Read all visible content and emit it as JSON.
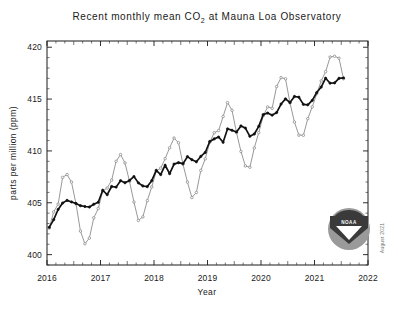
{
  "figure": {
    "title_part1": "Recent monthly mean CO",
    "title_sub": "2",
    "title_part2": " at Mauna Loa Observatory",
    "title_full": "Recent monthly mean CO2 at Mauna Loa Observatory",
    "credit": "August 2021",
    "logo_label": "NOAA",
    "colors": {
      "background": "#ffffff",
      "axis": "#1a1a1a",
      "monthly_series": "#8c8c8c",
      "trend_series": "#111111",
      "logo_ring": "#9a9a9a",
      "logo_band": "#3a3a3a"
    }
  },
  "chart_data": {
    "type": "line",
    "title": "Recent monthly mean CO2 at Mauna Loa Observatory",
    "xlabel": "Year",
    "ylabel": "parts per million (ppm)",
    "xlim": [
      2016.0,
      2022.0
    ],
    "ylim": [
      399.0,
      420.6
    ],
    "x_ticks": [
      "2016",
      "2017",
      "2018",
      "2019",
      "2020",
      "2021",
      "2022"
    ],
    "x_tick_values": [
      2016,
      2017,
      2018,
      2019,
      2020,
      2021,
      2022
    ],
    "x_minor_interval_months": 2,
    "y_ticks": [
      "400",
      "405",
      "410",
      "415",
      "420"
    ],
    "y_tick_values": [
      400,
      405,
      410,
      415,
      420
    ],
    "y_minor_interval": 1,
    "grid": false,
    "legend": false,
    "x": [
      2016.042,
      2016.125,
      2016.208,
      2016.292,
      2016.375,
      2016.458,
      2016.542,
      2016.625,
      2016.708,
      2016.792,
      2016.875,
      2016.958,
      2017.042,
      2017.125,
      2017.208,
      2017.292,
      2017.375,
      2017.458,
      2017.542,
      2017.625,
      2017.708,
      2017.792,
      2017.875,
      2017.958,
      2018.042,
      2018.125,
      2018.208,
      2018.292,
      2018.375,
      2018.458,
      2018.542,
      2018.625,
      2018.708,
      2018.792,
      2018.875,
      2018.958,
      2019.042,
      2019.125,
      2019.208,
      2019.292,
      2019.375,
      2019.458,
      2019.542,
      2019.625,
      2019.708,
      2019.792,
      2019.875,
      2019.958,
      2020.042,
      2020.125,
      2020.208,
      2020.292,
      2020.375,
      2020.458,
      2020.542,
      2020.625,
      2020.708,
      2020.792,
      2020.875,
      2020.958,
      2021.042,
      2021.125,
      2021.208,
      2021.292,
      2021.375,
      2021.458,
      2021.542
    ],
    "series": [
      {
        "name": "Monthly mean",
        "color": "#8c8c8c",
        "marker": "circle",
        "values": [
          402.56,
          404.12,
          404.87,
          407.45,
          407.72,
          406.99,
          404.89,
          402.27,
          401.05,
          401.59,
          403.55,
          404.45,
          406.13,
          406.42,
          407.18,
          409.0,
          409.65,
          408.84,
          407.07,
          405.07,
          403.3,
          403.64,
          405.21,
          406.53,
          408.05,
          408.34,
          409.25,
          410.3,
          411.24,
          410.79,
          408.71,
          406.99,
          405.51,
          405.99,
          408.12,
          409.24,
          410.83,
          411.75,
          411.97,
          413.32,
          414.66,
          413.92,
          411.77,
          409.95,
          408.55,
          408.43,
          410.29,
          411.76,
          413.4,
          414.24,
          414.11,
          416.21,
          417.07,
          416.96,
          414.62,
          412.78,
          411.52,
          411.51,
          413.11,
          414.25,
          415.52,
          416.75,
          417.64,
          419.05,
          419.13,
          418.94,
          416.96
        ]
      },
      {
        "name": "Seasonally adjusted trend",
        "color": "#111111",
        "marker": "circle",
        "values": [
          402.63,
          403.37,
          404.35,
          404.97,
          405.23,
          405.08,
          404.94,
          404.72,
          404.64,
          404.59,
          404.86,
          405.05,
          406.21,
          405.78,
          406.57,
          406.51,
          407.13,
          406.93,
          407.15,
          407.53,
          406.92,
          406.62,
          406.56,
          407.13,
          408.13,
          407.72,
          408.62,
          407.81,
          408.73,
          408.87,
          408.77,
          409.45,
          409.15,
          408.95,
          409.47,
          409.85,
          410.91,
          411.16,
          411.34,
          410.83,
          412.13,
          411.99,
          411.83,
          412.41,
          412.2,
          411.41,
          411.63,
          412.37,
          413.5,
          413.65,
          413.45,
          413.7,
          414.52,
          415.02,
          414.67,
          415.25,
          415.18,
          414.49,
          414.45,
          414.87,
          415.63,
          416.16,
          417.01,
          416.53,
          416.56,
          417.0,
          417.04
        ]
      }
    ]
  }
}
